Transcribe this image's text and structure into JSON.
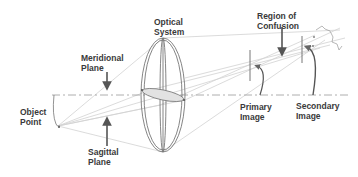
{
  "diagram": {
    "labels": {
      "optical_system": [
        "Optical",
        "System"
      ],
      "meridional_plane": [
        "Meridional",
        "Plane"
      ],
      "region_of_confusion": [
        "Region of",
        "Confusion"
      ],
      "object_point": [
        "Object",
        "Point"
      ],
      "sagittal_plane": [
        "Sagittal",
        "Plane"
      ],
      "primary_image": [
        "Primary",
        "Image"
      ],
      "secondary_image": [
        "Secondary",
        "Image"
      ]
    },
    "colors": {
      "text": "#3a3a3a",
      "arrow": "#555555",
      "lens_outline": "#777777",
      "rays": "#cfcfcf",
      "axis": "#999999",
      "lens_fill": "#e2e2e2"
    }
  }
}
